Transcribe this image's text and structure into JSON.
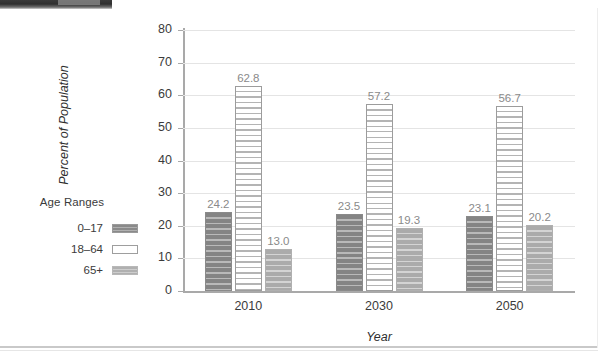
{
  "chart_data": {
    "type": "bar",
    "title": "",
    "xlabel": "Year",
    "ylabel": "Percent of Population",
    "categories": [
      "2010",
      "2030",
      "2050"
    ],
    "series": [
      {
        "name": "0–17",
        "values": [
          24.2,
          23.5,
          23.1
        ]
      },
      {
        "name": "18–64",
        "values": [
          62.8,
          57.2,
          56.7
        ]
      },
      {
        "name": "65+",
        "values": [
          13.0,
          19.3,
          20.2
        ]
      }
    ],
    "value_labels": [
      [
        "24.2",
        "23.5",
        "23.1"
      ],
      [
        "62.8",
        "57.2",
        "56.7"
      ],
      [
        "13.0",
        "19.3",
        "20.2"
      ]
    ],
    "ylim": [
      0,
      80
    ],
    "ytick_values": [
      80,
      70,
      60,
      50,
      40,
      30,
      20,
      10,
      0
    ],
    "ytick_labels": [
      "80",
      "70",
      "60",
      "50",
      "40",
      "30",
      "20",
      "10",
      "0"
    ],
    "grid": true,
    "legend_position": "left",
    "legend": {
      "title": "Age Ranges",
      "entries": [
        {
          "label": "0–17",
          "swatch": "dark-gray-striped"
        },
        {
          "label": "18–64",
          "swatch": "white-striped-outlined"
        },
        {
          "label": "65+",
          "swatch": "light-gray-striped"
        }
      ]
    },
    "colors": {
      "series_0_17": "#8c8c8c",
      "series_18_64": "#ffffff",
      "series_65plus": "#b2b2b2",
      "gridline": "#e4e4e4",
      "axis": "#a9a9a9",
      "value_label": "#8a8a8a",
      "tick_label": "#3b3b3b"
    }
  }
}
